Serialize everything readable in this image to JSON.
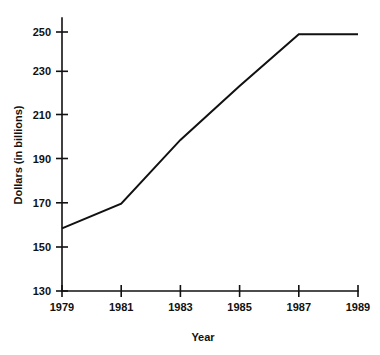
{
  "chart_data": {
    "type": "line",
    "title": "",
    "subtitle": "",
    "xlabel": "Year",
    "ylabel": "Dollars (in billions)",
    "x": [
      1979,
      1981,
      1983,
      1985,
      1987,
      1989
    ],
    "values": [
      159,
      170.5,
      200,
      225,
      249,
      249
    ],
    "series": [
      {
        "name": "Dollars (in billions)",
        "values": [
          159,
          170.5,
          200,
          225,
          249,
          249
        ]
      }
    ],
    "xtick_labels": [
      "1979",
      "1981",
      "1983",
      "1985",
      "1987",
      "1989"
    ],
    "ytick_labels": [
      "130",
      "150",
      "170",
      "190",
      "210",
      "230",
      "250"
    ],
    "ytick_values": [
      130,
      150,
      170,
      190,
      210,
      230,
      250
    ],
    "xlim": [
      1979,
      1989
    ],
    "ylim": [
      130,
      250
    ],
    "grid": false,
    "legend": false,
    "legend_position": "none",
    "line_color": "#111111",
    "background_color": "#ffffff"
  },
  "axis": {
    "y_label": "Dollars (in billions)",
    "x_label": "Year",
    "y_ticks": [
      {
        "label": "250",
        "value": 250
      },
      {
        "label": "230",
        "value": 230
      },
      {
        "label": "210",
        "value": 210
      },
      {
        "label": "190",
        "value": 190
      },
      {
        "label": "170",
        "value": 170
      },
      {
        "label": "150",
        "value": 150
      },
      {
        "label": "130",
        "value": 130
      }
    ],
    "x_ticks": [
      {
        "label": "1979",
        "value": 1979
      },
      {
        "label": "1981",
        "value": 1981
      },
      {
        "label": "1983",
        "value": 1983
      },
      {
        "label": "1985",
        "value": 1985
      },
      {
        "label": "1987",
        "value": 1987
      },
      {
        "label": "1989",
        "value": 1989
      }
    ]
  }
}
